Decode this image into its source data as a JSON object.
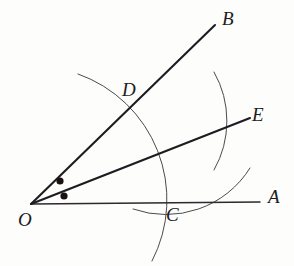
{
  "figure": {
    "background_color": "#fdfdfb",
    "stroke_color": "#1c1c22",
    "arc_color": "#4a4a50",
    "labels": {
      "O": "O",
      "A": "A",
      "B": "B",
      "C": "C",
      "D": "D",
      "E": "E"
    },
    "label_positions": {
      "O": {
        "x": 18,
        "y": 226
      },
      "A": {
        "x": 268,
        "y": 203
      },
      "B": {
        "x": 222,
        "y": 25
      },
      "C": {
        "x": 166,
        "y": 221
      },
      "D": {
        "x": 122,
        "y": 96
      },
      "E": {
        "x": 252,
        "y": 121
      }
    },
    "points": {
      "O": {
        "x": 31,
        "y": 204
      },
      "A": {
        "x": 260,
        "y": 202
      },
      "B": {
        "x": 215,
        "y": 25
      },
      "C": {
        "x": 163,
        "y": 203
      },
      "D": {
        "x": 126,
        "y": 110
      },
      "E": {
        "x": 250,
        "y": 118
      }
    },
    "rays": [
      {
        "name": "ray-OA",
        "from": "O",
        "to": "A",
        "d": "M 31 204 L 260 202"
      },
      {
        "name": "ray-OB",
        "from": "O",
        "to": "B",
        "d": "M 31 204 L 215 25"
      },
      {
        "name": "ray-OE-bisector",
        "from": "O",
        "to": "E",
        "d": "M 31 204 L 250 118"
      }
    ],
    "arcs": [
      {
        "name": "arc-centered-O",
        "center": "O",
        "radius": 133,
        "d": "M 152 261 A 133 133 0 0 0 78 74"
      },
      {
        "name": "arc-from-C-through-E",
        "center": "C",
        "radius": 99,
        "d": "M 214 72 A 99 99 0 0 1 214 170"
      },
      {
        "name": "arc-from-D-through-E",
        "center": "D",
        "radius": 99,
        "d": "M 133 209 A 99 99 0 0 0 250 168"
      }
    ],
    "angle_marks": [
      {
        "name": "angle-mark-upper",
        "x": 60,
        "y": 181,
        "r": 3.6
      },
      {
        "name": "angle-mark-lower",
        "x": 64,
        "y": 196,
        "r": 3.6
      }
    ]
  }
}
